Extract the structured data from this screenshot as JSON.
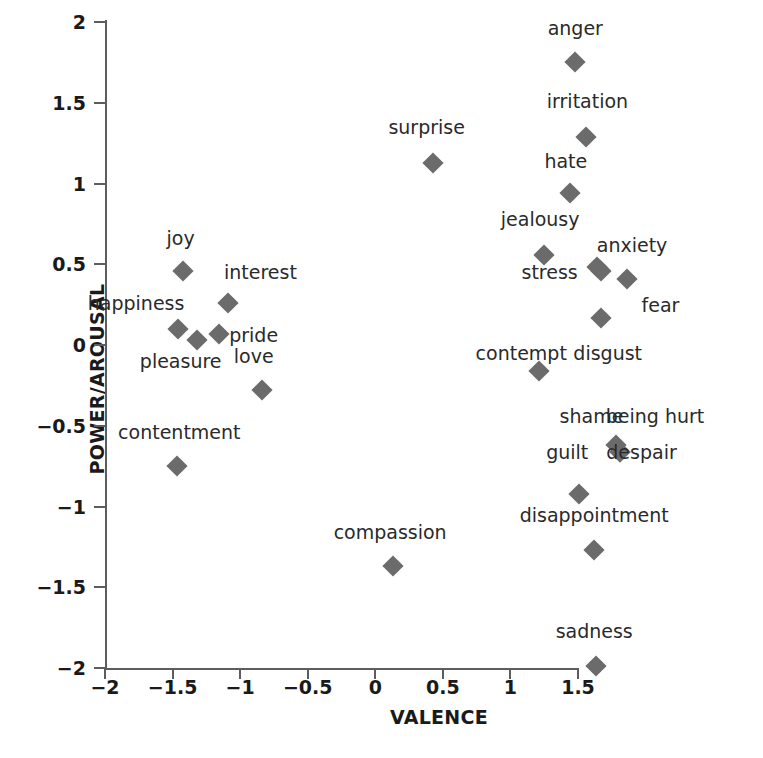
{
  "chart_data": {
    "type": "scatter",
    "title": "",
    "xlabel": "VALENCE",
    "ylabel": "POWER/AROUSAL",
    "xlim": [
      -2,
      1.5
    ],
    "ylim": [
      -2,
      2
    ],
    "xticks": [
      "−2",
      "−1.5",
      "−1",
      "−0.5",
      "0",
      "0.5",
      "1",
      "1.5"
    ],
    "xtick_values": [
      -2,
      -1.5,
      -1,
      -0.5,
      0,
      0.5,
      1,
      1.5
    ],
    "yticks": [
      "2",
      "1.5",
      "1",
      "0.5",
      "0",
      "−0.5",
      "−1",
      "−1.5",
      "−2"
    ],
    "ytick_values": [
      2,
      1.5,
      1,
      0.5,
      0,
      -0.5,
      -1,
      -1.5,
      -2
    ],
    "grid": false,
    "legend": false,
    "marker_shape": "diamond",
    "marker_color": "#6b6b6b",
    "points": [
      {
        "label": "anger",
        "x": 1.48,
        "y": 1.75,
        "lx": 1.48,
        "ly": 1.96
      },
      {
        "label": "irritation",
        "x": 1.56,
        "y": 1.29,
        "lx": 1.57,
        "ly": 1.51
      },
      {
        "label": "hate",
        "x": 1.44,
        "y": 0.94,
        "lx": 1.41,
        "ly": 1.14
      },
      {
        "label": "surprise",
        "x": 0.43,
        "y": 1.13,
        "lx": 0.38,
        "ly": 1.35
      },
      {
        "label": "jealousy",
        "x": 1.25,
        "y": 0.56,
        "lx": 1.22,
        "ly": 0.78
      },
      {
        "label": "stress",
        "x": 1.64,
        "y": 0.48,
        "lx": 1.29,
        "ly": 0.45
      },
      {
        "label": "anxiety",
        "x": 1.67,
        "y": 0.46,
        "lx": 1.9,
        "ly": 0.62
      },
      {
        "label": "fear",
        "x": 1.86,
        "y": 0.41,
        "lx": 2.11,
        "ly": 0.25
      },
      {
        "label": "disgust",
        "x": 1.67,
        "y": 0.17,
        "lx": 1.72,
        "ly": -0.05
      },
      {
        "label": "contempt",
        "x": 1.21,
        "y": -0.16,
        "lx": 1.08,
        "ly": -0.05
      },
      {
        "label": "shame",
        "x": 1.78,
        "y": -0.62,
        "lx": 1.6,
        "ly": -0.44
      },
      {
        "label": "being hurt",
        "x": 1.81,
        "y": -0.66,
        "lx": 2.07,
        "ly": -0.44
      },
      {
        "label": "despair",
        "x": 1.81,
        "y": -0.66,
        "lx": 1.97,
        "ly": -0.66
      },
      {
        "label": "guilt",
        "x": 1.51,
        "y": -0.92,
        "lx": 1.42,
        "ly": -0.66
      },
      {
        "label": "disappointment",
        "x": 1.62,
        "y": -1.27,
        "lx": 1.62,
        "ly": -1.05
      },
      {
        "label": "sadness",
        "x": 1.63,
        "y": -1.99,
        "lx": 1.62,
        "ly": -1.77
      },
      {
        "label": "compassion",
        "x": 0.13,
        "y": -1.37,
        "lx": 0.11,
        "ly": -1.16
      },
      {
        "label": "joy",
        "x": -1.42,
        "y": 0.46,
        "lx": -1.44,
        "ly": 0.66
      },
      {
        "label": "interest",
        "x": -1.09,
        "y": 0.26,
        "lx": -0.85,
        "ly": 0.45
      },
      {
        "label": "happiness",
        "x": -1.46,
        "y": 0.1,
        "lx": -1.77,
        "ly": 0.26
      },
      {
        "label": "pleasure",
        "x": -1.32,
        "y": 0.03,
        "lx": -1.44,
        "ly": -0.1
      },
      {
        "label": "pride",
        "x": -1.16,
        "y": 0.07,
        "lx": -0.9,
        "ly": 0.06
      },
      {
        "label": "love",
        "x": -0.84,
        "y": -0.28,
        "lx": -0.9,
        "ly": -0.07
      },
      {
        "label": "contentment",
        "x": -1.47,
        "y": -0.75,
        "lx": -1.45,
        "ly": -0.54
      }
    ]
  }
}
